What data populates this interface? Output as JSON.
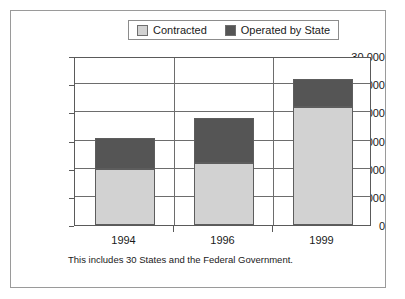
{
  "chart_data": {
    "type": "bar",
    "subtype": "stacked-vertical",
    "title": "",
    "xlabel": "",
    "ylabel": "",
    "categories": [
      "1994",
      "1996",
      "1999"
    ],
    "series": [
      {
        "name": "Contracted",
        "values": [
          10000,
          11000,
          21000
        ],
        "color": "#d2d2d2"
      },
      {
        "name": "Operated by State",
        "values": [
          5400,
          8000,
          5000
        ],
        "color": "#555555"
      }
    ],
    "totals": [
      15400,
      19000,
      26000
    ],
    "ylim": [
      0,
      30000
    ],
    "ytick_values": [
      0,
      5000,
      10000,
      15000,
      20000,
      25000,
      30000
    ],
    "ytick_labels": [
      "0",
      "5,000",
      "10,000",
      "15,000",
      "20,000",
      "25,000",
      "30,000"
    ],
    "grid": true,
    "grid_axis": "y",
    "legend_position": "top-center",
    "annotations": [
      "This includes 30 States and the Federal Government."
    ]
  },
  "legend": {
    "entries": [
      {
        "label": "Contracted",
        "swatch_color": "#d2d2d2",
        "icon": "legend-swatch-icon"
      },
      {
        "label": "Operated by State",
        "swatch_color": "#555555",
        "icon": "legend-swatch-icon"
      }
    ]
  },
  "footnote": {
    "text": "This includes 30 States and the Federal Government."
  }
}
